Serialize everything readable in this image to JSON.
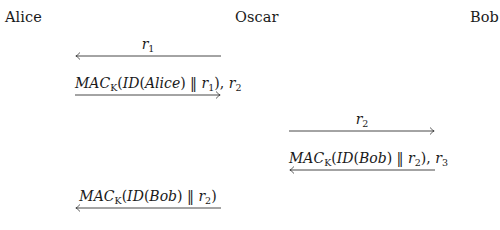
{
  "parties": [
    {
      "name": "Alice"
    },
    {
      "name": "Oscar"
    },
    {
      "name": "Bob"
    }
  ],
  "messages": [
    {
      "from": "Oscar",
      "to": "Alice",
      "direction": "left",
      "label_parts": {
        "var": "r",
        "sub": "1"
      },
      "text": "r1"
    },
    {
      "from": "Alice",
      "to": "Oscar",
      "direction": "right",
      "label_parts": {
        "mac": "MAC",
        "key": "K",
        "id_open": "(ID(",
        "ident": "Alice",
        "id_close": ") ‖ ",
        "var1": "r",
        "sub1": "1",
        "close": "), ",
        "var2": "r",
        "sub2": "2"
      },
      "text": "MAC_K(ID(Alice) || r1), r2"
    },
    {
      "from": "Oscar",
      "to": "Bob",
      "direction": "right",
      "label_parts": {
        "var": "r",
        "sub": "2"
      },
      "text": "r2"
    },
    {
      "from": "Bob",
      "to": "Oscar",
      "direction": "left",
      "label_parts": {
        "mac": "MAC",
        "key": "K",
        "id_open": "(ID(",
        "ident": "Bob",
        "id_close": ") ‖ ",
        "var1": "r",
        "sub1": "2",
        "close": "), ",
        "var2": "r",
        "sub2": "3"
      },
      "text": "MAC_K(ID(Bob) || r2), r3"
    },
    {
      "from": "Oscar",
      "to": "Alice",
      "direction": "left",
      "label_parts": {
        "mac": "MAC",
        "key": "K",
        "id_open": "(ID(",
        "ident": "Bob",
        "id_close": ") ‖ ",
        "var1": "r",
        "sub1": "2",
        "close": ")"
      },
      "text": "MAC_K(ID(Bob) || r2)"
    }
  ],
  "colors": {
    "text": "#1a1a1a",
    "arrow": "#333333",
    "background": "#ffffff"
  }
}
